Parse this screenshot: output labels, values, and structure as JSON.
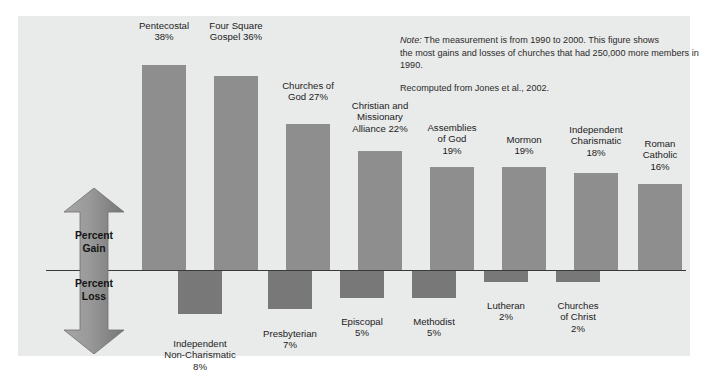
{
  "figure": {
    "background_color": "#ffffff",
    "panel_color": "#e9eaea",
    "gain_bar_color": "#8e8e8e",
    "loss_bar_color": "#787878",
    "axis_color": "#3a3a3a"
  },
  "note": {
    "label": "Note:",
    "line1": " The measurement is from 1990 to 2000. This figure shows",
    "line2": "the most gains and losses of churches that had 250,000 more members in 1990.",
    "source": "Recomputed from Jones et al., 2002."
  },
  "axis_arrow": {
    "gain_label": "Percent\nGain",
    "loss_label": "Percent\nLoss"
  },
  "chart_data": {
    "type": "bar",
    "title": "",
    "subtitle": "",
    "xlabel": "",
    "ylabel": "Percent Gain / Percent Loss",
    "ylim": [
      -8,
      38
    ],
    "grid": false,
    "legend": "none",
    "categories": [
      "Pentecostal",
      "Four Square Gospel",
      "Churches of God",
      "Christian and Missionary Alliance",
      "Assemblies of God",
      "Mormon",
      "Independent Charismatic",
      "Roman Catholic",
      "Independent Non-Charismatic",
      "Presbyterian",
      "Episcopal",
      "Methodist",
      "Lutheran",
      "Churches of Christ"
    ],
    "values": [
      38,
      36,
      27,
      22,
      19,
      19,
      18,
      16,
      -8,
      -7,
      -5,
      -5,
      -2,
      -2
    ],
    "bars": [
      {
        "name": "Pentecostal",
        "label": "Pentecostal\n38%",
        "value": 38,
        "direction": "gain",
        "x": 124,
        "width": 44,
        "label_x": 104,
        "label_width": 84,
        "label_y": 4
      },
      {
        "name": "Four Square Gospel",
        "label": "Four Square\nGospel 36%",
        "value": 36,
        "direction": "gain",
        "x": 196,
        "width": 44,
        "label_x": 176,
        "label_width": 84,
        "label_y": 4
      },
      {
        "name": "Churches of God",
        "label": "Churches of\nGod 27%",
        "value": 27,
        "direction": "gain",
        "x": 268,
        "width": 44,
        "label_x": 248,
        "label_width": 84,
        "label_y": 64
      },
      {
        "name": "Christian and Missionary Alliance",
        "label": "Christian and\nMissionary\nAlliance 22%",
        "value": 22,
        "direction": "gain",
        "x": 340,
        "width": 44,
        "label_x": 318,
        "label_width": 88,
        "label_y": 84
      },
      {
        "name": "Assemblies of God",
        "label": "Assemblies\nof God\n19%",
        "value": 19,
        "direction": "gain",
        "x": 412,
        "width": 44,
        "label_x": 394,
        "label_width": 80,
        "label_y": 106
      },
      {
        "name": "Mormon",
        "label": "Mormon\n19%",
        "value": 19,
        "direction": "gain",
        "x": 484,
        "width": 44,
        "label_x": 466,
        "label_width": 80,
        "label_y": 118
      },
      {
        "name": "Independent Charismatic",
        "label": "Independent\nCharismatic\n18%",
        "value": 18,
        "direction": "gain",
        "x": 556,
        "width": 44,
        "label_x": 532,
        "label_width": 92,
        "label_y": 108
      },
      {
        "name": "Roman Catholic",
        "label": "Roman\nCatholic\n16%",
        "value": 16,
        "direction": "gain",
        "x": 620,
        "width": 44,
        "label_x": 602,
        "label_width": 80,
        "label_y": 122
      },
      {
        "name": "Independent Non-Charismatic",
        "label": "Independent\nNon-Charismatic\n8%",
        "value": -8,
        "direction": "loss",
        "x": 160,
        "width": 44,
        "label_x": 126,
        "label_width": 112,
        "label_y": 322
      },
      {
        "name": "Presbyterian",
        "label": "Presbyterian\n7%",
        "value": -7,
        "direction": "loss",
        "x": 250,
        "width": 44,
        "label_x": 224,
        "label_width": 96,
        "label_y": 312
      },
      {
        "name": "Episcopal",
        "label": "Episcopal\n5%",
        "value": -5,
        "direction": "loss",
        "x": 322,
        "width": 44,
        "label_x": 300,
        "label_width": 88,
        "label_y": 300
      },
      {
        "name": "Methodist",
        "label": "Methodist\n5%",
        "value": -5,
        "direction": "loss",
        "x": 394,
        "width": 44,
        "label_x": 372,
        "label_width": 88,
        "label_y": 300
      },
      {
        "name": "Lutheran",
        "label": "Lutheran\n2%",
        "value": -2,
        "direction": "loss",
        "x": 466,
        "width": 44,
        "label_x": 444,
        "label_width": 88,
        "label_y": 284
      },
      {
        "name": "Churches of Christ",
        "label": "Churches\nof Christ\n2%",
        "value": -2,
        "direction": "loss",
        "x": 538,
        "width": 44,
        "label_x": 516,
        "label_width": 88,
        "label_y": 284
      }
    ]
  }
}
